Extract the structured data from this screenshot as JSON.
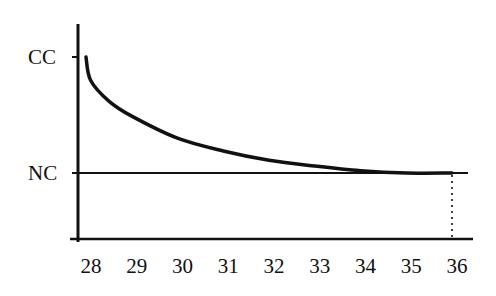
{
  "chart_data": {
    "type": "line",
    "title": "",
    "xlabel": "",
    "ylabel": "",
    "x_ticks": [
      "28",
      "29",
      "30",
      "31",
      "32",
      "33",
      "34",
      "35",
      "36"
    ],
    "y_ticks": [
      "NC",
      "CC"
    ],
    "xlim": [
      27.85,
      36.5
    ],
    "ylim_note": "qualitative axis: CC (top level) and NC (lower level)",
    "grid": false,
    "legend": null,
    "series": [
      {
        "name": "decay curve (CC to NC)",
        "x": [
          28.0,
          28.1,
          28.5,
          29,
          30,
          31,
          32,
          33,
          34,
          35,
          36
        ],
        "y_normalized": [
          1.0,
          0.8,
          0.62,
          0.49,
          0.3,
          0.19,
          0.11,
          0.06,
          0.02,
          0.0,
          0.0
        ]
      }
    ],
    "reference_lines": [
      {
        "type": "horizontal",
        "label": "NC",
        "value_normalized": 0.0,
        "style": "solid",
        "x_end": 36.35
      },
      {
        "type": "vertical",
        "at_x": 36,
        "style": "dotted",
        "from": "NC",
        "to": "x-axis"
      }
    ]
  },
  "axis": {
    "y_labels": {
      "top": "CC",
      "bottom": "NC"
    },
    "x_labels": [
      "28",
      "29",
      "30",
      "31",
      "32",
      "33",
      "34",
      "35",
      "36"
    ]
  },
  "colors": {
    "ink": "#111111",
    "background": "#ffffff"
  }
}
